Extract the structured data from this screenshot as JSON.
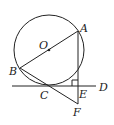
{
  "diagram": {
    "type": "geometry",
    "colors": {
      "stroke": "#222222",
      "background": "#ffffff"
    },
    "circle": {
      "label": "O",
      "cx": 49,
      "cy": 50,
      "r": 35
    },
    "points": {
      "A": {
        "label": "A",
        "x": 78,
        "y": 31
      },
      "B": {
        "label": "B",
        "x": 20,
        "y": 68
      },
      "C": {
        "label": "C",
        "x": 48,
        "y": 86
      },
      "D": {
        "label": "D",
        "x": 96,
        "y": 86
      },
      "E": {
        "label": "E",
        "x": 78,
        "y": 86
      },
      "F": {
        "label": "F",
        "x": 78,
        "y": 104
      },
      "O": {
        "label": "O",
        "x": 49,
        "y": 50
      }
    },
    "segments": [
      {
        "from": "A",
        "to": "B"
      },
      {
        "from": "A",
        "to": "F"
      },
      {
        "from": "B",
        "to": "F"
      },
      {
        "from": "line-start",
        "to": "D"
      }
    ],
    "right_angle_at": "E"
  }
}
